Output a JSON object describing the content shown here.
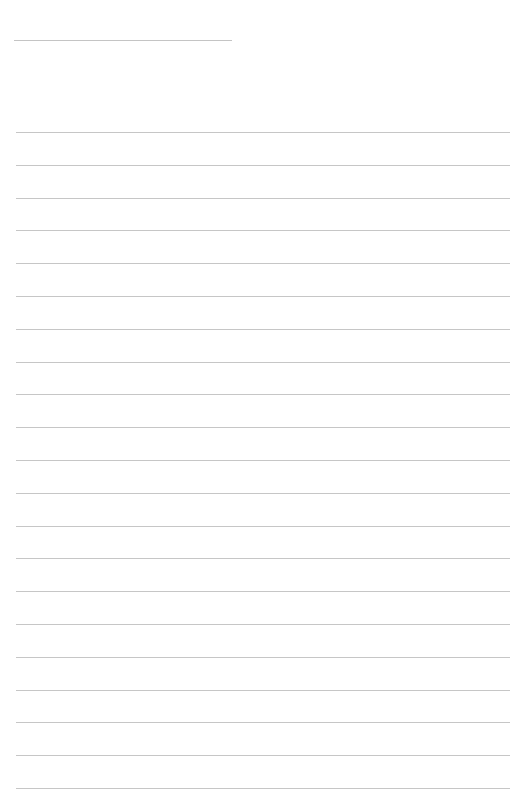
{
  "page": {
    "type": "blank lined paper",
    "background": "#ffffff",
    "line_color": "#c6c6c6",
    "header_line": {
      "top": 40,
      "left": 14,
      "width": 218
    },
    "ruled_lines": {
      "count": 21,
      "first_top": 132,
      "spacing": 32.8,
      "left": 16,
      "width": 494
    }
  }
}
